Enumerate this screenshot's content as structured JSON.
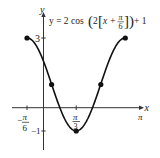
{
  "chart_data": {
    "type": "line",
    "equation": "y = 2 cos(2[x + π/6]) + 1",
    "xlabel": "x",
    "ylabel": "y",
    "x_tick_labels": [
      "-π/6",
      "π/3",
      "π"
    ],
    "y_tick_labels": [
      "3",
      "-1"
    ],
    "xlim": [
      -0.6,
      1.05
    ],
    "ylim": [
      -1.8,
      4.1
    ],
    "grid": false,
    "series": [
      {
        "name": "y = 2cos(2[x+π/6]) + 1",
        "domain": [
          "-π/6",
          "5π/6"
        ],
        "marked_points": [
          {
            "x": "-π/6",
            "y": 3
          },
          {
            "x": "π/12",
            "y": 1
          },
          {
            "x": "π/3",
            "y": -1
          },
          {
            "x": "7π/12",
            "y": 1
          },
          {
            "x": "5π/6",
            "y": 3
          }
        ]
      }
    ]
  },
  "labels": {
    "y_axis": "y",
    "x_axis": "x",
    "tick_3": "3",
    "tick_neg1": "−1",
    "tick_neg_pi6_num": "π",
    "tick_neg_pi6_den": "6",
    "tick_pi3_num": "π",
    "tick_pi3_den": "3",
    "tick_pi": "π",
    "eq_prefix": "y = 2 cos",
    "eq_two": "2",
    "eq_x": "x +",
    "eq_frac_num": "π",
    "eq_frac_den": "6",
    "eq_suffix": "+ 1"
  }
}
